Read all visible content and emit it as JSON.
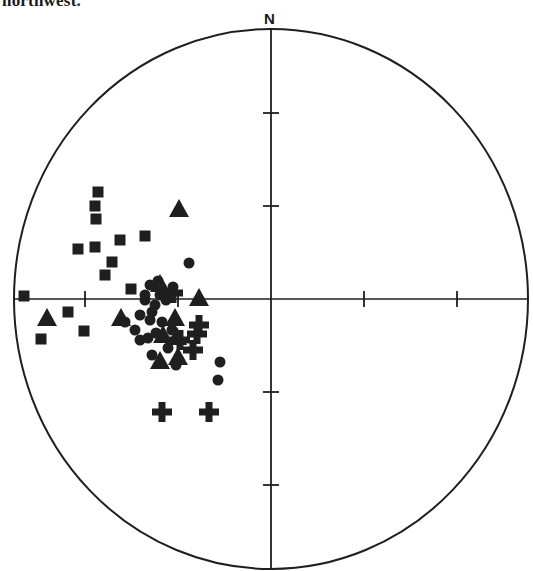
{
  "caption": "northwest.",
  "chart_data": {
    "type": "scatter",
    "north_label": "N",
    "grid": false,
    "net": {
      "center_px": [
        271,
        299
      ],
      "radius_px": 257,
      "tick_spacing_px": 93,
      "ticks_per_axis": 2
    },
    "colors": {
      "ink": "#1f1f1f",
      "background": "#ffffff"
    },
    "series": [
      {
        "name": "squares",
        "marker": "square",
        "points": [
          [
            98,
            192
          ],
          [
            95,
            206
          ],
          [
            96,
            219
          ],
          [
            78,
            249
          ],
          [
            95,
            247
          ],
          [
            120,
            240
          ],
          [
            145,
            236
          ],
          [
            112,
            262
          ],
          [
            105,
            275
          ],
          [
            24,
            296
          ],
          [
            68,
            312
          ],
          [
            84,
            331
          ],
          [
            41,
            339
          ],
          [
            131,
            289
          ]
        ]
      },
      {
        "name": "triangles",
        "marker": "triangle",
        "points": [
          [
            179,
            209
          ],
          [
            199,
            298
          ],
          [
            47,
            318
          ],
          [
            160,
            284
          ],
          [
            121,
            318
          ],
          [
            175,
            318
          ],
          [
            177,
            337
          ],
          [
            163,
            335
          ],
          [
            178,
            357
          ],
          [
            160,
            361
          ]
        ]
      },
      {
        "name": "circles",
        "marker": "circle",
        "points": [
          [
            189,
            263
          ],
          [
            150,
            285
          ],
          [
            158,
            281
          ],
          [
            173,
            287
          ],
          [
            145,
            300
          ],
          [
            155,
            305
          ],
          [
            166,
            300
          ],
          [
            140,
            315
          ],
          [
            150,
            320
          ],
          [
            162,
            322
          ],
          [
            125,
            322
          ],
          [
            135,
            330
          ],
          [
            148,
            338
          ],
          [
            156,
            333
          ],
          [
            168,
            348
          ],
          [
            152,
            355
          ],
          [
            176,
            365
          ],
          [
            220,
            362
          ],
          [
            218,
            380
          ],
          [
            145,
            295
          ],
          [
            160,
            295
          ],
          [
            152,
            312
          ],
          [
            140,
            340
          ],
          [
            172,
            330
          ]
        ]
      },
      {
        "name": "crosses",
        "marker": "plus",
        "points": [
          [
            173,
            293
          ],
          [
            199,
            325
          ],
          [
            197,
            334
          ],
          [
            193,
            350
          ],
          [
            162,
            412
          ],
          [
            209,
            412
          ],
          [
            180,
            340
          ]
        ]
      }
    ]
  }
}
